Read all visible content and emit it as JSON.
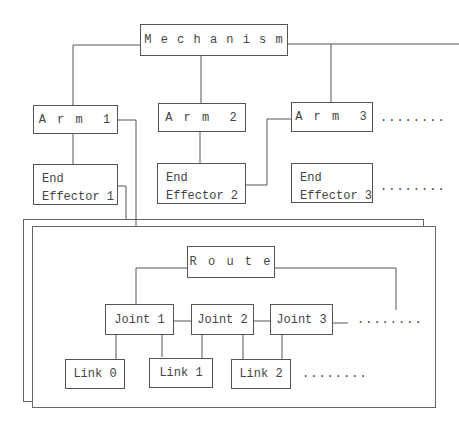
{
  "diagram": {
    "root": "M e c h a n i s m",
    "arms": [
      "A r m  1",
      "A r m  2",
      "A r m  3"
    ],
    "end_effectors": [
      {
        "line1": "End",
        "line2": "Effector 1"
      },
      {
        "line1": "End",
        "line2": "Effector 2"
      },
      {
        "line1": "End",
        "line2": "Effector 3"
      }
    ],
    "arm_ellipsis": "........",
    "ee_ellipsis": "........",
    "route": "R o u t e",
    "joints": [
      "Joint 1",
      "Joint 2",
      "Joint 3"
    ],
    "joint_ellipsis": "........",
    "links": [
      "Link 0",
      "Link 1",
      "Link 2"
    ],
    "link_ellipsis": "........",
    "line_color": "#555555"
  }
}
